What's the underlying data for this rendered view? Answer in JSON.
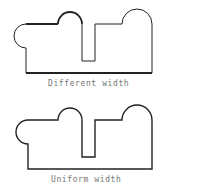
{
  "figures": [
    {
      "id": "different",
      "caption": "Different width",
      "stroke_color": "#222222",
      "thin_width": 1,
      "thick_width": 2
    },
    {
      "id": "uniform",
      "caption": "Uniform width",
      "stroke_color": "#222222",
      "thin_width": 1.4
    }
  ]
}
